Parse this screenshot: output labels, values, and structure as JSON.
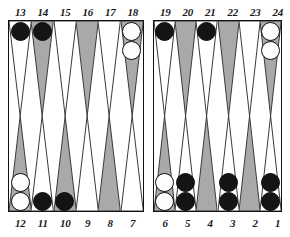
{
  "board": {
    "title": "Backgammon Board",
    "colors": {
      "point_light": "#ffffff",
      "point_dark": "#a9a9a9",
      "checker_black": "#141414",
      "checker_white": "#fdfdfd",
      "border": "#111111",
      "label_text": "#1a1a1a",
      "background": "#ffffff"
    },
    "labels": {
      "top_left": [
        "13",
        "14",
        "15",
        "16",
        "17",
        "18"
      ],
      "top_right": [
        "19",
        "20",
        "21",
        "22",
        "23",
        "24"
      ],
      "bottom_left": [
        "12",
        "11",
        "10",
        "9",
        "8",
        "7"
      ],
      "bottom_right": [
        "6",
        "5",
        "4",
        "3",
        "2",
        "1"
      ]
    },
    "quadrants": {
      "top_left": [
        {
          "point": "13",
          "triangle": "light",
          "checker_color": "black",
          "count": 1
        },
        {
          "point": "14",
          "triangle": "dark",
          "checker_color": "black",
          "count": 1
        },
        {
          "point": "15",
          "triangle": "light",
          "checker_color": "none",
          "count": 0
        },
        {
          "point": "16",
          "triangle": "dark",
          "checker_color": "none",
          "count": 0
        },
        {
          "point": "17",
          "triangle": "light",
          "checker_color": "none",
          "count": 0
        },
        {
          "point": "18",
          "triangle": "dark",
          "checker_color": "white",
          "count": 2
        }
      ],
      "top_right": [
        {
          "point": "19",
          "triangle": "light",
          "checker_color": "black",
          "count": 1
        },
        {
          "point": "20",
          "triangle": "dark",
          "checker_color": "none",
          "count": 0
        },
        {
          "point": "21",
          "triangle": "light",
          "checker_color": "black",
          "count": 1
        },
        {
          "point": "22",
          "triangle": "dark",
          "checker_color": "none",
          "count": 0
        },
        {
          "point": "23",
          "triangle": "light",
          "checker_color": "none",
          "count": 0
        },
        {
          "point": "24",
          "triangle": "dark",
          "checker_color": "white",
          "count": 2
        }
      ],
      "bottom_left": [
        {
          "point": "12",
          "triangle": "dark",
          "checker_color": "white",
          "count": 2
        },
        {
          "point": "11",
          "triangle": "light",
          "checker_color": "black",
          "count": 1
        },
        {
          "point": "10",
          "triangle": "dark",
          "checker_color": "black",
          "count": 1
        },
        {
          "point": "9",
          "triangle": "light",
          "checker_color": "none",
          "count": 0
        },
        {
          "point": "8",
          "triangle": "dark",
          "checker_color": "none",
          "count": 0
        },
        {
          "point": "7",
          "triangle": "light",
          "checker_color": "none",
          "count": 0
        }
      ],
      "bottom_right": [
        {
          "point": "6",
          "triangle": "dark",
          "checker_color": "white",
          "count": 2
        },
        {
          "point": "5",
          "triangle": "light",
          "checker_color": "black",
          "count": 2
        },
        {
          "point": "4",
          "triangle": "dark",
          "checker_color": "none",
          "count": 0
        },
        {
          "point": "3",
          "triangle": "light",
          "checker_color": "black",
          "count": 2
        },
        {
          "point": "2",
          "triangle": "dark",
          "checker_color": "none",
          "count": 0
        },
        {
          "point": "1",
          "triangle": "light",
          "checker_color": "black",
          "count": 2
        }
      ]
    }
  }
}
